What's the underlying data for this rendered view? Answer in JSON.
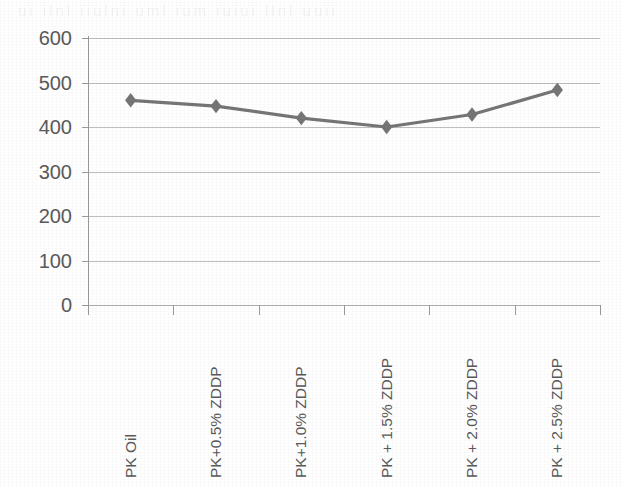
{
  "chart_data": {
    "type": "line",
    "title": "",
    "xlabel": "",
    "ylabel": "",
    "categories": [
      "PK Oil",
      "PK+0.5% ZDDP",
      "PK+1.0% ZDDP",
      "PK + 1.5% ZDDP",
      "PK + 2.0% ZDDP",
      "PK + 2.5% ZDDP"
    ],
    "values": [
      460,
      447,
      420,
      400,
      428,
      483
    ],
    "series": [
      {
        "name": "",
        "values": [
          460,
          447,
          420,
          400,
          428,
          483
        ]
      }
    ],
    "ylim": [
      0,
      600
    ],
    "ytick_step": 100,
    "yticks": [
      "600",
      "500",
      "400",
      "300",
      "200",
      "100",
      "0"
    ],
    "grid": true,
    "legend": false,
    "legend_position": "none",
    "marker": "diamond",
    "series_color": "#767676",
    "gridline_color": "#b9b9b9",
    "axis_color": "#9b9b9b",
    "label_color": "#5a5a5a",
    "background_color": "#ffffff"
  },
  "scan_artifact": {
    "ghost_text": "ui ilnl iiulni uml ium iuiui llnl uuii"
  }
}
